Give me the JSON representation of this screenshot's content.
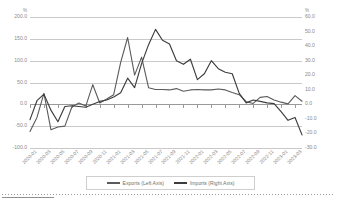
{
  "chart_data": {
    "type": "line",
    "title": "",
    "xlabel": "",
    "ylabel": "%",
    "ylabel_right": "%",
    "grid": true,
    "legend_position": "bottom",
    "ylim": [
      -100.0,
      200.0
    ],
    "ylim_right": [
      -30.0,
      60.0
    ],
    "y_ticks_left": [
      "200.0",
      "150.0",
      "100.0",
      "50.0",
      "0.0",
      "-50.0",
      "-100.0"
    ],
    "y_ticks_right": [
      "60.0",
      "50.0",
      "40.0",
      "30.0",
      "20.0",
      "10.0",
      "0.0",
      "-10.0",
      "-20.0",
      "-30.0"
    ],
    "x_tick_labels": [
      "2020-01",
      "2020-03",
      "2020-05",
      "2020-07",
      "2020-09",
      "2020-11",
      "2021-01",
      "2021-03",
      "2021-05",
      "2021-07",
      "2021-09",
      "2021-11",
      "2022-01",
      "2022-03",
      "2022-05",
      "2022-07",
      "2022-09",
      "2022-11",
      "2023-01",
      "2023-03"
    ],
    "x": [
      "2020-01",
      "2020-02",
      "2020-03",
      "2020-04",
      "2020-05",
      "2020-06",
      "2020-07",
      "2020-08",
      "2020-09",
      "2020-10",
      "2020-11",
      "2020-12",
      "2021-01",
      "2021-02",
      "2021-03",
      "2021-04",
      "2021-05",
      "2021-06",
      "2021-07",
      "2021-08",
      "2021-09",
      "2021-10",
      "2021-11",
      "2021-12",
      "2022-01",
      "2022-02",
      "2022-03",
      "2022-04",
      "2022-05",
      "2022-06",
      "2022-07",
      "2022-08",
      "2022-09",
      "2022-10",
      "2022-11",
      "2022-12",
      "2023-01",
      "2023-02",
      "2023-03",
      "2023-04"
    ],
    "series": [
      {
        "name": "Exports (Left Axis)",
        "axis": "left",
        "color": "#5a5a5a",
        "values": [
          -62.0,
          -30.0,
          25.0,
          -58.0,
          -52.0,
          -50.0,
          -6.0,
          3.0,
          -4.0,
          45.0,
          3.0,
          12.0,
          22.0,
          96.0,
          153.0,
          67.0,
          108.0,
          38.0,
          34.0,
          34.0,
          33.0,
          36.0,
          30.0,
          33.0,
          34.0,
          33.0,
          33.0,
          35.0,
          33.0,
          27.0,
          22.0,
          6.0,
          2.0,
          16.0,
          18.0,
          10.0,
          5.0,
          1.0,
          20.0,
          7.0
        ]
      },
      {
        "name": "Imports (Right Axis)",
        "axis": "right",
        "color": "#3d3d3d",
        "values": [
          -10.5,
          2.5,
          7.0,
          -4.0,
          -12.0,
          -1.5,
          -1.0,
          -1.5,
          -2.0,
          0.0,
          2.0,
          3.0,
          5.0,
          8.0,
          18.0,
          11.5,
          28.0,
          41.0,
          51.5,
          44.0,
          41.5,
          30.0,
          27.5,
          31.0,
          17.0,
          21.0,
          30.0,
          24.5,
          22.0,
          21.0,
          7.5,
          1.0,
          3.0,
          2.0,
          1.0,
          0.5,
          -5.0,
          -11.0,
          -9.0,
          -21.0
        ]
      }
    ]
  },
  "legend": {
    "exports_label": "Exports (Left Axis)",
    "imports_label": "Imports (Right Axis)"
  },
  "units": {
    "left": "%",
    "right": "%"
  }
}
